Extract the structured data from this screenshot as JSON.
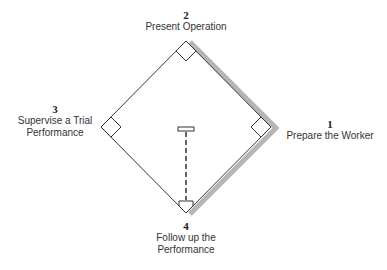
{
  "diagram": {
    "type": "baseball-diamond-process",
    "colors": {
      "line": "#333333",
      "shadow": "#b5b5b5",
      "background": "#ffffff"
    },
    "bases": [
      {
        "number": "1",
        "line1": "Prepare the Worker",
        "line2": ""
      },
      {
        "number": "2",
        "line1": "Present Operation",
        "line2": ""
      },
      {
        "number": "3",
        "line1": "Supervise a Trial",
        "line2": "Performance"
      },
      {
        "number": "4",
        "line1": "Follow up the",
        "line2": "Performance"
      }
    ]
  }
}
